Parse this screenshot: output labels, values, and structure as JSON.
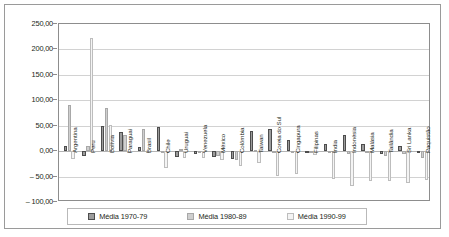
{
  "chart_data": {
    "type": "bar",
    "title": "",
    "subtitle": "",
    "xlabel": "",
    "ylabel": "",
    "ylim": [
      -100,
      250
    ],
    "ytick_step": 50,
    "ytick_labels": [
      "250,00",
      "200,00",
      "150,00",
      "100,00",
      "50,00",
      "0,00",
      "– 50,00",
      "– 100,00"
    ],
    "ytick_values": [
      250,
      200,
      150,
      100,
      50,
      0,
      -50,
      -100
    ],
    "grid": true,
    "legend_position": "bottom",
    "categories": [
      "Argentina",
      "Peru",
      "Bolívia",
      "Paraguai",
      "Brasil",
      "Chile",
      "Uruguai",
      "Venezuela",
      "México",
      "Colômbia",
      "Taiwan",
      "Coreia do Sul",
      "Cingapura",
      "Filipinas",
      "Índia",
      "Indonésia",
      "Malásia",
      "Tailândia",
      "Sri Lanka",
      "Paquistão"
    ],
    "series": [
      {
        "name": "Média 1970-79",
        "color": "#9c9c9c",
        "values": [
          11,
          -9,
          50,
          38,
          8,
          47,
          -11,
          -6,
          -12,
          -16,
          40,
          43,
          21,
          -2,
          14,
          32,
          15,
          -6,
          11,
          -4
        ]
      },
      {
        "name": "Média 1980-89",
        "color": "#cfcfcf",
        "values": [
          90,
          10,
          84,
          31,
          43,
          -2,
          5,
          -3,
          -9,
          -18,
          2,
          -2,
          -3,
          -2,
          -3,
          -5,
          -4,
          -9,
          -5,
          -14
        ]
      },
      {
        "name": "Média 1990-99",
        "color": "#f4f4f4",
        "values": [
          -15,
          223,
          52,
          -2,
          -3,
          -33,
          -14,
          -14,
          -17,
          -30,
          -24,
          -48,
          -44,
          -8,
          -54,
          -68,
          -58,
          -58,
          -62,
          -56
        ]
      }
    ]
  },
  "legend": {
    "items": [
      {
        "label": "Média 1970-79"
      },
      {
        "label": "Média 1980-89"
      },
      {
        "label": "Média 1990-99"
      }
    ]
  }
}
